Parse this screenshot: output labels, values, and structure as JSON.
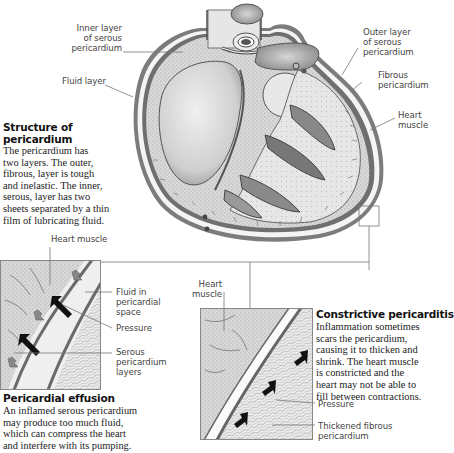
{
  "diagram": {
    "main_labels": {
      "inner_layer": "Inner layer\nof serous\npericardium",
      "fluid_layer": "Fluid layer",
      "outer_layer": "Outer layer\nof serous\npericardium",
      "fibrous": "Fibrous\npericardium",
      "heart_muscle": "Heart\nmuscle"
    },
    "structure": {
      "title": "Structure of\npericardium",
      "text": "The pericardium has\ntwo layers. The outer,\nfibrous, layer is tough\nand inelastic. The inner,\nserous, layer has two\nsheets separated by a thin\nfilm of lubricating fluid."
    },
    "effusion": {
      "labels": {
        "heart_muscle": "Heart muscle",
        "fluid": "Fluid in\npericardial\nspace",
        "pressure": "Pressure",
        "serous": "Serous\npericardium\nlayers"
      },
      "title": "Pericardial effusion",
      "text": "An inflamed serous pericardium\nmay produce too much fluid,\nwhich can compress the heart\nand interfere with its pumping."
    },
    "constrictive": {
      "labels": {
        "heart_muscle": "Heart\nmuscle",
        "pressure": "Pressure",
        "thickened": "Thickened fibrous\npericardium"
      },
      "title": "Constrictive pericarditis",
      "text": "Inflammation sometimes\nscars the pericardium,\ncausing it to thicken and\nshrink. The heart muscle\nis constricted and the\nheart may not be able to\nfill between contractions."
    }
  }
}
